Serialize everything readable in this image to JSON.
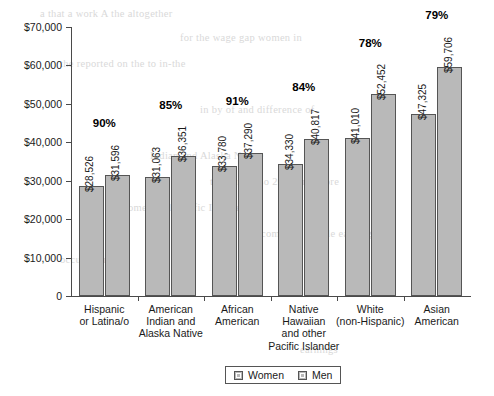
{
  "chart_data": {
    "type": "bar",
    "title": "",
    "subtitle": "",
    "xlabel": "",
    "ylabel": "",
    "ylim": [
      0,
      70000
    ],
    "grid": false,
    "legend_position": "bottom-center",
    "ytick_labels": [
      "$70,000",
      "$60,000",
      "$50,000",
      "$40,000",
      "$30,000",
      "$20,000",
      "$10,000",
      "0"
    ],
    "ytick_values": [
      70000,
      60000,
      50000,
      40000,
      30000,
      20000,
      10000,
      0
    ],
    "categories": [
      "Hispanic\nor Latina/o",
      "American\nIndian and\nAlaska Native",
      "African\nAmerican",
      "Native\nHawaiian\nand other\nPacific Islander",
      "White\n(non-Hispanic)",
      "Asian\nAmerican"
    ],
    "series": [
      {
        "name": "Women",
        "values": [
          28526,
          31063,
          33780,
          34330,
          41010,
          47325
        ],
        "labels": [
          "$28,526",
          "$31,063",
          "$33,780",
          "$34,330",
          "$41,010",
          "$47,325"
        ],
        "color": "#b9b9b9"
      },
      {
        "name": "Men",
        "values": [
          31596,
          36351,
          37290,
          40817,
          52452,
          59706
        ],
        "labels": [
          "$31,596",
          "$36,351",
          "$37,290",
          "$40,817",
          "$52,452",
          "$59,706"
        ],
        "color": "#b9b9b9"
      }
    ],
    "annotations": {
      "ratio_labels": [
        "90%",
        "85%",
        "91%",
        "84%",
        "78%",
        "79%"
      ]
    }
  },
  "legend": {
    "items": [
      {
        "label": "Women"
      },
      {
        "label": "Men"
      }
    ]
  },
  "ghost_text": {
    "lines": [
      "a that a work A the altogether",
      "for the wage gap women in",
      "the reported on the to in-the",
      "in by of and difference of",
      "Indian and Alaska Native",
      "than and also 2013 and more",
      "women and Pacific Islander",
      "of income the middle earning",
      "occupations",
      "earnings"
    ]
  }
}
